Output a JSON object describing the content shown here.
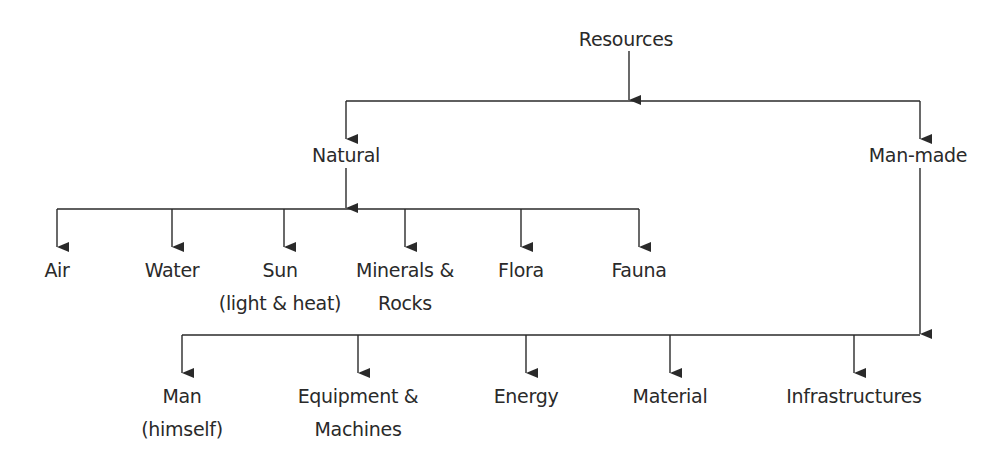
{
  "diagram": {
    "type": "hierarchy",
    "line_color": "#2a2a2a",
    "text_color": "#2a2a2a",
    "root": {
      "id": "resources",
      "label": "Resources",
      "x": 626,
      "y": 23
    },
    "level1": [
      {
        "id": "natural",
        "label": "Natural",
        "x": 346,
        "y": 139
      },
      {
        "id": "man-made",
        "label": "Man-made",
        "x": 918,
        "y": 139
      }
    ],
    "natural_children": [
      {
        "id": "air",
        "lines": [
          "Air"
        ],
        "x": 57
      },
      {
        "id": "water",
        "lines": [
          "Water"
        ],
        "x": 172
      },
      {
        "id": "sun",
        "lines": [
          "Sun",
          "(light & heat)"
        ],
        "x": 284
      },
      {
        "id": "minerals-rocks",
        "lines": [
          "Minerals &",
          "Rocks"
        ],
        "x": 405
      },
      {
        "id": "flora",
        "lines": [
          "Flora"
        ],
        "x": 521
      },
      {
        "id": "fauna",
        "lines": [
          "Fauna"
        ],
        "x": 639
      }
    ],
    "man_made_children": [
      {
        "id": "man",
        "lines": [
          "Man",
          "(himself)"
        ],
        "x": 182
      },
      {
        "id": "equipment-machines",
        "lines": [
          "Equipment &",
          "Machines"
        ],
        "x": 358
      },
      {
        "id": "energy",
        "lines": [
          "Energy"
        ],
        "x": 526
      },
      {
        "id": "material",
        "lines": [
          "Material"
        ],
        "x": 670
      },
      {
        "id": "infrastructures",
        "lines": [
          "Infrastructures"
        ],
        "x": 854
      }
    ]
  }
}
